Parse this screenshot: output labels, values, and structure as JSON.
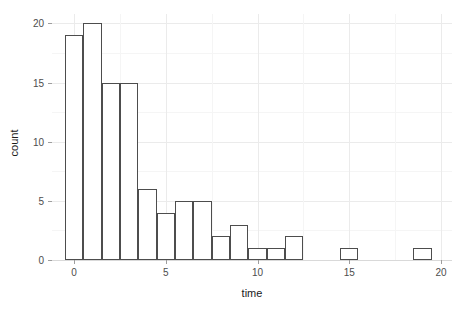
{
  "chart_data": {
    "type": "bar",
    "title": "",
    "subtitle": "",
    "xlabel": "time",
    "ylabel": "count",
    "xlim": [
      -1.2,
      20.6
    ],
    "ylim": [
      0,
      20.8
    ],
    "grid": true,
    "legend": null,
    "binwidth": 1,
    "bin_edges": [
      -0.5,
      0.5,
      1.5,
      2.5,
      3.5,
      4.5,
      5.5,
      6.5,
      7.5,
      8.5,
      9.5,
      10.5,
      11.5,
      12.5,
      13.5,
      14.5,
      15.5,
      16.5,
      17.5,
      18.5,
      19.5
    ],
    "categories": [
      0,
      1,
      2,
      3,
      4,
      5,
      6,
      7,
      8,
      9,
      10,
      11,
      12,
      13,
      14,
      15,
      16,
      17,
      18,
      19
    ],
    "values": [
      19,
      20,
      15,
      15,
      6,
      4,
      5,
      5,
      2,
      3,
      1,
      1,
      2,
      0,
      0,
      1,
      0,
      0,
      0,
      1
    ],
    "x_ticks": [
      0,
      5,
      10,
      15,
      20
    ],
    "x_tick_labels": [
      "0",
      "5",
      "10",
      "15",
      "20"
    ],
    "x_minor_ticks": [
      2.5,
      7.5,
      12.5,
      17.5
    ],
    "y_ticks": [
      0,
      5,
      10,
      15,
      20
    ],
    "y_tick_labels": [
      "0",
      "5",
      "10",
      "15",
      "20"
    ],
    "y_minor_ticks": [
      2.5,
      7.5,
      12.5,
      17.5
    ],
    "colors": {
      "bar_fill": "#ffffff",
      "bar_border": "#4d4d4d",
      "panel_background": "#ffffff",
      "grid_major": "#ebebeb",
      "grid_minor": "#f5f5f5",
      "axis_line": "#d9d9d9",
      "tick_mark": "#9e9e9e",
      "tick_label": "#4d4d4d",
      "axis_title": "#1a1a1a"
    }
  }
}
